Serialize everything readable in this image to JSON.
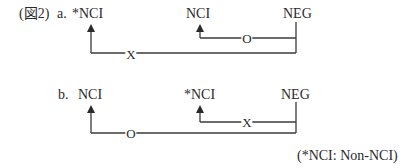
{
  "figure": {
    "label": "(図2)",
    "footnote": "(*NCI: Non-NCI)"
  },
  "diagram_a": {
    "letter": "a.",
    "nodes": [
      {
        "id": "a-left",
        "text": "*NCI"
      },
      {
        "id": "a-mid",
        "text": "NCI"
      },
      {
        "id": "a-right",
        "text": "NEG"
      }
    ],
    "relations": [
      {
        "from": "NEG",
        "to": "*NCI",
        "mark": "X",
        "level": "outer"
      },
      {
        "from": "NEG",
        "to": "NCI",
        "mark": "O",
        "level": "inner"
      }
    ]
  },
  "diagram_b": {
    "letter": "b.",
    "nodes": [
      {
        "id": "b-left",
        "text": "NCI"
      },
      {
        "id": "b-mid",
        "text": "*NCI"
      },
      {
        "id": "b-right",
        "text": "NEG"
      }
    ],
    "relations": [
      {
        "from": "NEG",
        "to": "NCI",
        "mark": "O",
        "level": "outer"
      },
      {
        "from": "NEG",
        "to": "*NCI",
        "mark": "X",
        "level": "inner"
      }
    ]
  }
}
